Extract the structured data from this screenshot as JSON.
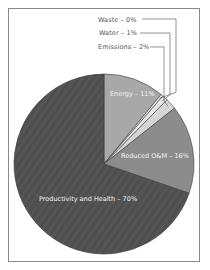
{
  "chart_data": {
    "type": "pie",
    "title": "",
    "categories": [
      "Energy",
      "Reduced O&M",
      "Productivity and Health",
      "Emissions",
      "Water",
      "Waste"
    ],
    "values": [
      11,
      16,
      70,
      2,
      1,
      0
    ],
    "labels": {
      "waste": "Waste – 0%",
      "water": "Water – 1%",
      "emissions": "Emissions – 2%",
      "energy": "Energy – 11%",
      "om": "Reduced O&M – 16%",
      "productivity": "Productivity and Health – 70%"
    },
    "colors": {
      "energy": "#a8a8a8",
      "om": "#8c8c8c",
      "productivity": "#555555",
      "emissions": "#d6d6d6",
      "water": "#e6e6e6",
      "waste": "#f0f0f0"
    },
    "legend_position": "callouts-top-right",
    "grid": false
  }
}
